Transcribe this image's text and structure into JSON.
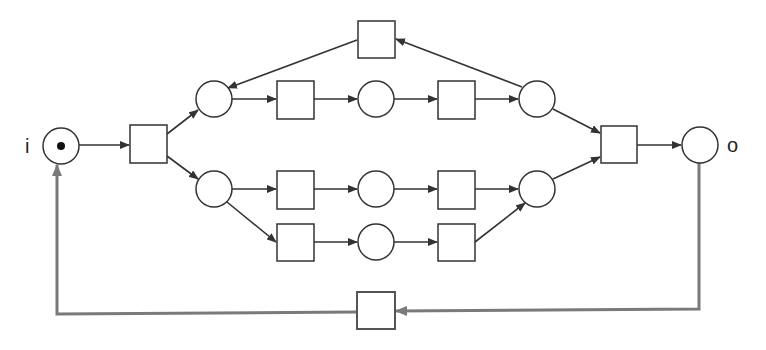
{
  "diagram": {
    "type": "petri-net",
    "labels": {
      "source": "i",
      "sink": "o"
    },
    "colors": {
      "stroke": "#333333",
      "feedback": "#7a7a7a",
      "token": "#111111",
      "background": "#ffffff"
    },
    "places": [
      {
        "id": "i",
        "cx": 61,
        "cy": 146,
        "r": 18,
        "tokens": 1
      },
      {
        "id": "p1",
        "cx": 214,
        "cy": 99,
        "r": 18,
        "tokens": 0
      },
      {
        "id": "p2",
        "cx": 376,
        "cy": 99,
        "r": 18,
        "tokens": 0
      },
      {
        "id": "p3",
        "cx": 537,
        "cy": 99,
        "r": 18,
        "tokens": 0
      },
      {
        "id": "p4",
        "cx": 214,
        "cy": 189,
        "r": 18,
        "tokens": 0
      },
      {
        "id": "p5",
        "cx": 376,
        "cy": 189,
        "r": 18,
        "tokens": 0
      },
      {
        "id": "p6",
        "cx": 537,
        "cy": 189,
        "r": 18,
        "tokens": 0
      },
      {
        "id": "p7",
        "cx": 376,
        "cy": 242,
        "r": 18,
        "tokens": 0
      },
      {
        "id": "o",
        "cx": 700,
        "cy": 145,
        "r": 18,
        "tokens": 0
      }
    ],
    "transitions": [
      {
        "id": "t1",
        "x": 130,
        "y": 125,
        "w": 37,
        "h": 38
      },
      {
        "id": "t_loop",
        "x": 358,
        "y": 21,
        "w": 37,
        "h": 37
      },
      {
        "id": "t2",
        "x": 277,
        "y": 81,
        "w": 37,
        "h": 38
      },
      {
        "id": "t3",
        "x": 438,
        "y": 81,
        "w": 37,
        "h": 38
      },
      {
        "id": "t4",
        "x": 277,
        "y": 171,
        "w": 37,
        "h": 38
      },
      {
        "id": "t5",
        "x": 438,
        "y": 171,
        "w": 37,
        "h": 38
      },
      {
        "id": "t6",
        "x": 277,
        "y": 224,
        "w": 37,
        "h": 37
      },
      {
        "id": "t7",
        "x": 438,
        "y": 224,
        "w": 37,
        "h": 37
      },
      {
        "id": "t8",
        "x": 601,
        "y": 126,
        "w": 36,
        "h": 37
      },
      {
        "id": "t_reset",
        "x": 357,
        "y": 292,
        "w": 38,
        "h": 37
      }
    ],
    "arcs": [
      {
        "from": "i",
        "to": "t1"
      },
      {
        "from": "t1",
        "to": "p1"
      },
      {
        "from": "t1",
        "to": "p4"
      },
      {
        "from": "p1",
        "to": "t2"
      },
      {
        "from": "t2",
        "to": "p2"
      },
      {
        "from": "p2",
        "to": "t3"
      },
      {
        "from": "t3",
        "to": "p3"
      },
      {
        "from": "p3",
        "to": "t_loop"
      },
      {
        "from": "t_loop",
        "to": "p1"
      },
      {
        "from": "p4",
        "to": "t4"
      },
      {
        "from": "t4",
        "to": "p5"
      },
      {
        "from": "p5",
        "to": "t5"
      },
      {
        "from": "t5",
        "to": "p6"
      },
      {
        "from": "p4",
        "to": "t6"
      },
      {
        "from": "t6",
        "to": "p7"
      },
      {
        "from": "p7",
        "to": "t7"
      },
      {
        "from": "t7",
        "to": "p6"
      },
      {
        "from": "p3",
        "to": "t8"
      },
      {
        "from": "p6",
        "to": "t8"
      },
      {
        "from": "t8",
        "to": "o"
      },
      {
        "from": "o",
        "to": "t_reset",
        "style": "feedback"
      },
      {
        "from": "t_reset",
        "to": "i",
        "style": "feedback"
      }
    ]
  }
}
